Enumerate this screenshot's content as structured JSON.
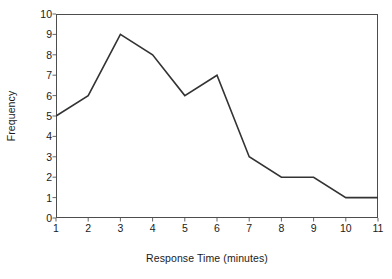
{
  "chart_data": {
    "type": "line",
    "title": "",
    "subtitle": "",
    "xlabel": "Response Time (minutes)",
    "ylabel": "Frequency",
    "x": [
      1,
      2,
      3,
      4,
      5,
      6,
      7,
      8,
      9,
      10,
      11
    ],
    "values": [
      5,
      6,
      9,
      8,
      6,
      7,
      3,
      2,
      2,
      1,
      1
    ],
    "series": [
      {
        "name": "Frequency",
        "values": [
          5,
          6,
          9,
          8,
          6,
          7,
          3,
          2,
          2,
          1,
          1
        ]
      }
    ],
    "xlim": [
      1,
      11
    ],
    "ylim": [
      0,
      10
    ],
    "xticks": [
      "1",
      "2",
      "3",
      "4",
      "5",
      "6",
      "7",
      "8",
      "9",
      "10",
      "11"
    ],
    "yticks": [
      "0",
      "1",
      "2",
      "3",
      "4",
      "5",
      "6",
      "7",
      "8",
      "9",
      "10"
    ],
    "grid": false,
    "legend": false,
    "legend_position": "none",
    "markers": false,
    "line_color": "#333333",
    "frame_color": "#4d4d4d",
    "background_color": "#ffffff"
  }
}
